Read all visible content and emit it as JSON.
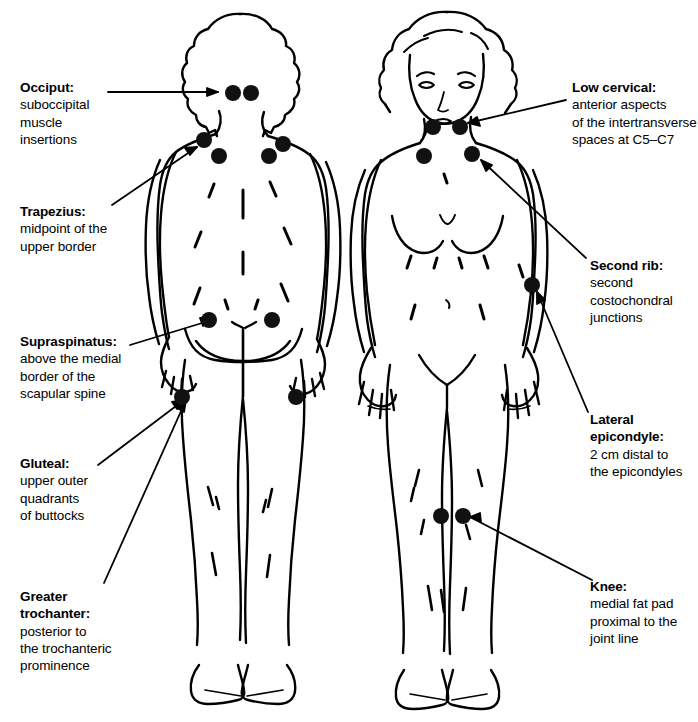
{
  "diagram": {
    "figures": [
      {
        "name": "posterior-figure",
        "view": "posterior",
        "side": "left"
      },
      {
        "name": "anterior-figure",
        "view": "anterior",
        "side": "right"
      }
    ],
    "ink_color": "#000000",
    "background_color": "#ffffff",
    "dot_color": "#111111"
  },
  "labels_left": [
    {
      "key": "occiput",
      "heading": "Occiput:",
      "lines": [
        "suboccipital",
        "muscle",
        "insertions"
      ]
    },
    {
      "key": "trapezius",
      "heading": "Trapezius:",
      "lines": [
        "midpoint of the",
        "upper border"
      ]
    },
    {
      "key": "supraspinatus",
      "heading": "Supraspinatus:",
      "lines": [
        "above the medial",
        "border of the",
        "scapular spine"
      ]
    },
    {
      "key": "gluteal",
      "heading": "Gluteal:",
      "lines": [
        "upper outer",
        "quadrants",
        "of buttocks"
      ]
    },
    {
      "key": "greater-trochanter",
      "heading": "Greater",
      "heading2": "trochanter:",
      "lines": [
        "posterior to",
        "the trochanteric",
        "prominence"
      ]
    }
  ],
  "labels_right": [
    {
      "key": "low-cervical",
      "heading": "Low cervical:",
      "lines": [
        "anterior aspects",
        "of the intertransverse",
        "spaces at C5–C7"
      ]
    },
    {
      "key": "second-rib",
      "heading": "Second rib:",
      "lines": [
        "second",
        "costochondral",
        "junctions"
      ]
    },
    {
      "key": "lateral-epicondyle",
      "heading": "Lateral",
      "heading2": "epicondyle:",
      "lines": [
        "2 cm distal to",
        "the epicondyles"
      ]
    },
    {
      "key": "knee",
      "heading": "Knee:",
      "lines": [
        "medial fat pad",
        "proximal  to the",
        "joint line"
      ]
    }
  ],
  "tender_points": [
    {
      "name": "occiput-left",
      "cx": 233,
      "cy": 93,
      "r": 8.0
    },
    {
      "name": "occiput-right",
      "cx": 251,
      "cy": 93,
      "r": 8.0
    },
    {
      "name": "trapezius-left",
      "cx": 204,
      "cy": 140,
      "r": 8.0
    },
    {
      "name": "trapezius-right",
      "cx": 283,
      "cy": 144,
      "r": 8.0
    },
    {
      "name": "supraspinatus-left",
      "cx": 219,
      "cy": 156,
      "r": 8.0
    },
    {
      "name": "supraspinatus-right",
      "cx": 269,
      "cy": 156,
      "r": 8.0
    },
    {
      "name": "gluteal-left",
      "cx": 209,
      "cy": 320,
      "r": 8.0
    },
    {
      "name": "gluteal-right",
      "cx": 272,
      "cy": 320,
      "r": 8.0
    },
    {
      "name": "greater-trochanter-left",
      "cx": 182,
      "cy": 397,
      "r": 8.0
    },
    {
      "name": "greater-trochanter-right",
      "cx": 296,
      "cy": 397,
      "r": 8.0
    },
    {
      "name": "low-cervical-left",
      "cx": 433,
      "cy": 127,
      "r": 8.0
    },
    {
      "name": "low-cervical-right",
      "cx": 460,
      "cy": 127,
      "r": 8.0
    },
    {
      "name": "second-rib-left",
      "cx": 424,
      "cy": 156,
      "r": 8.0
    },
    {
      "name": "second-rib-right",
      "cx": 472,
      "cy": 154,
      "r": 8.0
    },
    {
      "name": "lateral-epicondyle-right",
      "cx": 532,
      "cy": 285,
      "r": 8.0
    },
    {
      "name": "knee-left",
      "cx": 441,
      "cy": 516,
      "r": 8.0
    },
    {
      "name": "knee-right",
      "cx": 463,
      "cy": 516,
      "r": 8.0
    }
  ]
}
